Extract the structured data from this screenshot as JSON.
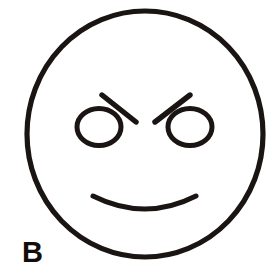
{
  "figure": {
    "panel_label": "B",
    "background_color": "#ffffff",
    "ink_color": "#1a1412",
    "label_color": "#120d0c"
  },
  "geometry": {
    "canvas": {
      "width": 276,
      "height": 280
    },
    "head": {
      "name": "head-outline",
      "shape": "ellipse",
      "cx": 145,
      "cy": 134,
      "rx": 118,
      "ry": 123,
      "stroke_width": 5.2
    },
    "left_eye": {
      "name": "left-eye",
      "shape": "ellipse",
      "cx": 99,
      "cy": 127,
      "rx": 22,
      "ry": 18.5,
      "stroke_width": 5.0
    },
    "right_eye": {
      "name": "right-eye",
      "shape": "ellipse",
      "cx": 190,
      "cy": 127,
      "rx": 22,
      "ry": 18.5,
      "stroke_width": 5.0
    },
    "left_eyebrow": {
      "name": "left-eyebrow",
      "shape": "line",
      "x1": 102,
      "y1": 95,
      "x2": 136,
      "y2": 122,
      "stroke_width": 5.4
    },
    "right_eyebrow": {
      "name": "right-eyebrow",
      "shape": "line",
      "x1": 155,
      "y1": 122,
      "x2": 190,
      "y2": 95,
      "stroke_width": 5.4
    },
    "mouth": {
      "name": "mouth",
      "shape": "arc",
      "x1": 93,
      "y1": 196,
      "cx": 145,
      "cy": 222,
      "x2": 196,
      "y2": 196,
      "stroke_width": 5.0
    }
  }
}
